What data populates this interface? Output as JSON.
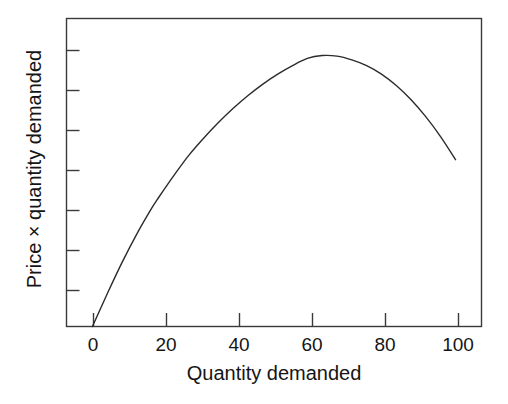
{
  "chart_data": {
    "type": "line",
    "title": "",
    "subtitle": "",
    "xlabel": "Quantity demanded",
    "ylabel": "Price × quantity demanded",
    "xlim": [
      -5,
      107
    ],
    "ylim": [
      0,
      1.08
    ],
    "grid": false,
    "legend": null,
    "annotations": [],
    "x_ticks": [
      0,
      20,
      40,
      60,
      80,
      100
    ],
    "x_tick_labels": [
      "0",
      "20",
      "40",
      "60",
      "80",
      "100"
    ],
    "y_ticks": [
      0.12,
      0.26,
      0.4,
      0.54,
      0.68,
      0.82,
      0.96
    ],
    "y_tick_labels": [
      "",
      "",
      "",
      "",
      "",
      "",
      ""
    ],
    "series": [
      {
        "name": "Total revenue",
        "color": "#2b2b2b",
        "line_width": 1.4,
        "x": [
          2,
          6,
          10,
          14,
          18,
          20,
          24,
          28,
          32,
          36,
          40,
          44,
          48,
          52,
          56,
          60,
          64,
          68,
          72,
          76,
          80,
          84,
          88,
          92,
          96,
          100
        ],
        "y": [
          0.0,
          0.115,
          0.225,
          0.325,
          0.415,
          0.455,
          0.53,
          0.6,
          0.66,
          0.715,
          0.765,
          0.81,
          0.85,
          0.885,
          0.915,
          0.94,
          0.95,
          0.948,
          0.935,
          0.915,
          0.885,
          0.845,
          0.795,
          0.735,
          0.665,
          0.585
        ]
      }
    ],
    "peak": {
      "x": 64,
      "y": 0.95
    },
    "start_point": {
      "x": 2,
      "y": 0.0
    },
    "end_point": {
      "x": 100,
      "y": 0.585
    }
  },
  "axes": {
    "x_title": "Quantity demanded",
    "y_title": "Price × quantity demanded",
    "x_tick_labels": [
      "0",
      "20",
      "40",
      "60",
      "80",
      "100"
    ],
    "frame_color": "#3a3a3a"
  },
  "colors": {
    "background": "#ffffff",
    "curve": "#2b2b2b",
    "axis": "#3a3a3a",
    "text": "#151515"
  }
}
